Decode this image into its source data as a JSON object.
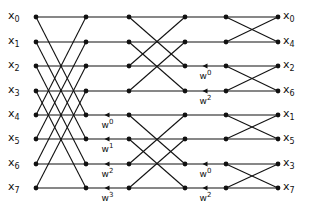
{
  "diagram": {
    "line_color": "#111111",
    "columns_x": [
      36,
      86,
      129,
      185,
      226,
      278
    ],
    "rows_y": [
      17,
      42,
      66,
      91,
      115,
      139,
      164,
      188
    ],
    "inputs": [
      {
        "base": "x",
        "sub": "0"
      },
      {
        "base": "x",
        "sub": "1"
      },
      {
        "base": "x",
        "sub": "2"
      },
      {
        "base": "x",
        "sub": "3"
      },
      {
        "base": "x",
        "sub": "4"
      },
      {
        "base": "x",
        "sub": "5"
      },
      {
        "base": "x",
        "sub": "6"
      },
      {
        "base": "x",
        "sub": "7"
      }
    ],
    "outputs": [
      {
        "base": "x",
        "sub": "0"
      },
      {
        "base": "x",
        "sub": "4"
      },
      {
        "base": "x",
        "sub": "2"
      },
      {
        "base": "x",
        "sub": "6"
      },
      {
        "base": "x",
        "sub": "1"
      },
      {
        "base": "x",
        "sub": "5"
      },
      {
        "base": "x",
        "sub": "3"
      },
      {
        "base": "x",
        "sub": "7"
      }
    ],
    "stage1_twiddles": [
      {
        "row": 4,
        "base": "w",
        "exp": "0"
      },
      {
        "row": 5,
        "base": "w",
        "exp": "1"
      },
      {
        "row": 6,
        "base": "w",
        "exp": "2"
      },
      {
        "row": 7,
        "base": "w",
        "exp": "3"
      }
    ],
    "stage2_twiddles": [
      {
        "row": 2,
        "base": "w",
        "exp": "0"
      },
      {
        "row": 3,
        "base": "w",
        "exp": "2"
      },
      {
        "row": 6,
        "base": "w",
        "exp": "0"
      },
      {
        "row": 7,
        "base": "w",
        "exp": "2"
      }
    ]
  }
}
